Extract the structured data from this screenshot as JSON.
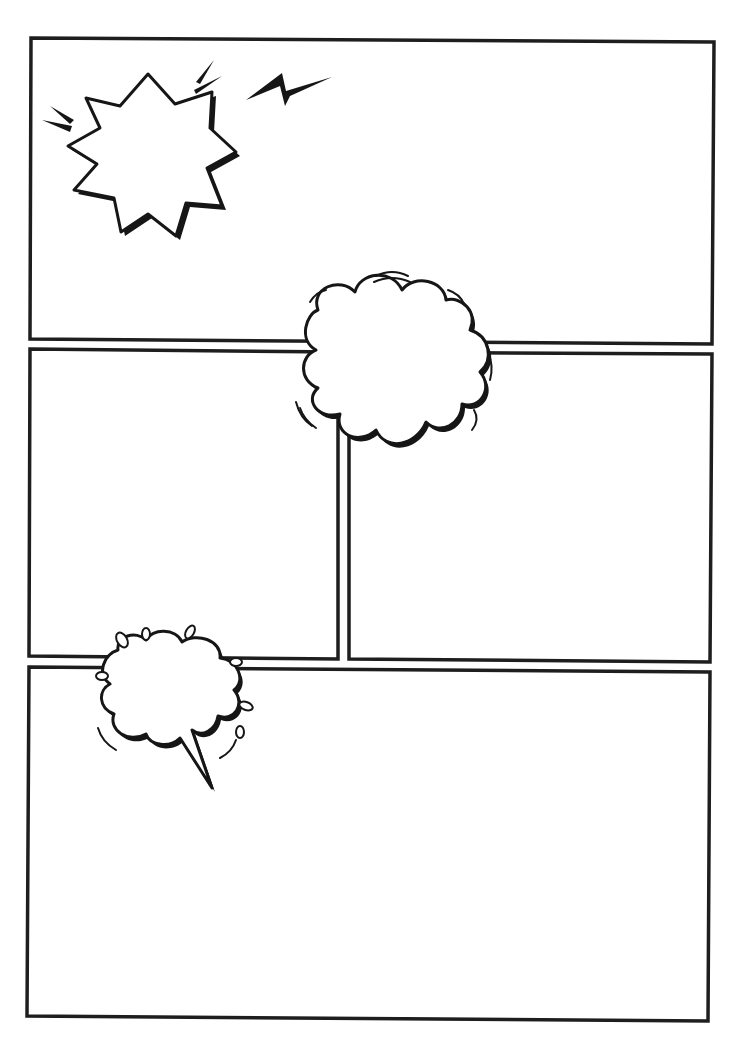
{
  "page": {
    "type": "comic-page-template",
    "background": "#ffffff",
    "ink_color": "#1e1e1e"
  },
  "panels": [
    {
      "id": "panel-1",
      "label": "top wide panel",
      "corners": [
        [
          31,
          38
        ],
        [
          714,
          42
        ],
        [
          712,
          344
        ],
        [
          30,
          339
        ]
      ]
    },
    {
      "id": "panel-2",
      "label": "middle left panel",
      "corners": [
        [
          30,
          349
        ],
        [
          338,
          352
        ],
        [
          338,
          659
        ],
        [
          29,
          656
        ]
      ]
    },
    {
      "id": "panel-3",
      "label": "middle right panel",
      "corners": [
        [
          349,
          352
        ],
        [
          712,
          354
        ],
        [
          710,
          662
        ],
        [
          349,
          659
        ]
      ]
    },
    {
      "id": "panel-4",
      "label": "bottom wide panel",
      "corners": [
        [
          29,
          667
        ],
        [
          710,
          672
        ],
        [
          708,
          1021
        ],
        [
          27,
          1016
        ]
      ]
    }
  ],
  "decorations": [
    {
      "id": "explosion-burst",
      "icon": "starburst-icon",
      "center": [
        145,
        150
      ]
    },
    {
      "id": "lightning-bolt",
      "icon": "lightning-icon",
      "center": [
        290,
        88
      ]
    },
    {
      "id": "thought-cloud",
      "icon": "cloud-bubble-icon",
      "center": [
        395,
        365
      ]
    },
    {
      "id": "speech-cloud",
      "icon": "speech-cloud-icon",
      "center": [
        170,
        690
      ]
    }
  ]
}
